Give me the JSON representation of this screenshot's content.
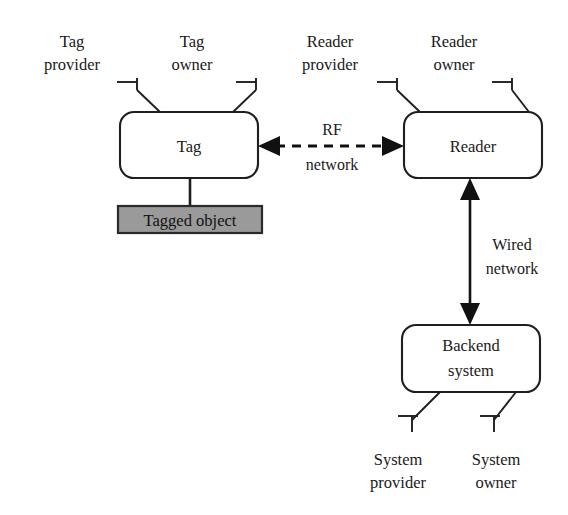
{
  "diagram": {
    "background_color": "#ffffff",
    "line_color": "#1f1f1f",
    "object_fill_color": "#9a9a9a"
  },
  "nodes": {
    "tag": {
      "label": "Tag"
    },
    "reader": {
      "label": "Reader"
    },
    "backend": {
      "label_line1": "Backend",
      "label_line2": "system"
    },
    "tagged_object": {
      "label": "Tagged object"
    }
  },
  "roles": {
    "tag_provider": {
      "line1": "Tag",
      "line2": "provider"
    },
    "tag_owner": {
      "line1": "Tag",
      "line2": "owner"
    },
    "reader_provider": {
      "line1": "Reader",
      "line2": "provider"
    },
    "reader_owner": {
      "line1": "Reader",
      "line2": "owner"
    },
    "system_provider": {
      "line1": "System",
      "line2": "provider"
    },
    "system_owner": {
      "line1": "System",
      "line2": "owner"
    }
  },
  "edges": {
    "rf_network": {
      "line1": "RF",
      "line2": "network"
    },
    "wired_network": {
      "line1": "Wired",
      "line2": "network"
    }
  }
}
